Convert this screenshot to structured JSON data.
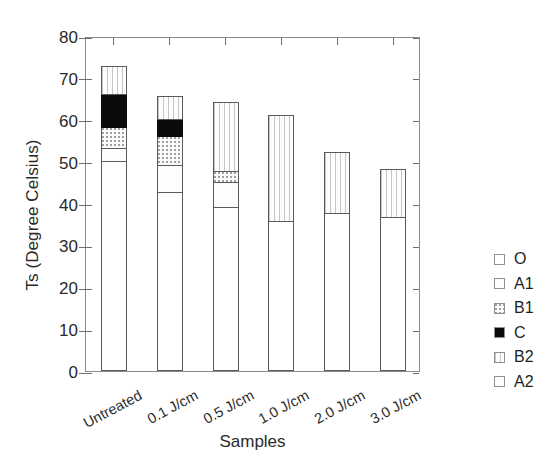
{
  "chart_data": {
    "type": "bar",
    "title": "",
    "subtitle": "",
    "xlabel": "Samples",
    "ylabel": "Ts (Degree Celsius)",
    "ylim": [
      0,
      80
    ],
    "yticks": [
      0,
      10,
      20,
      30,
      40,
      50,
      60,
      70,
      80
    ],
    "ytick_labels": [
      "0",
      "10",
      "20",
      "30",
      "40",
      "50",
      "60",
      "70",
      "80"
    ],
    "grid": false,
    "legend_position": "right",
    "stacked": true,
    "categories": [
      "Untreated",
      "0.1 J/cm",
      "0.5 J/cm",
      "1.0 J/cm",
      "2.0 J/cm",
      "3.0 J/cm"
    ],
    "series": [
      {
        "name": "O",
        "pattern": "white",
        "values": [
          50.0,
          42.5,
          39.0,
          35.5,
          37.5,
          36.5
        ]
      },
      {
        "name": "A1",
        "pattern": "fine-dot",
        "values": [
          3.0,
          6.5,
          6.0,
          0.0,
          0.0,
          0.0
        ]
      },
      {
        "name": "B1",
        "pattern": "dense-stipple",
        "values": [
          5.0,
          7.0,
          2.5,
          0.0,
          0.0,
          0.0
        ]
      },
      {
        "name": "C",
        "pattern": "solid-black",
        "values": [
          8.0,
          4.0,
          0.0,
          0.0,
          0.0,
          0.0
        ]
      },
      {
        "name": "B2",
        "pattern": "vertical-dash",
        "values": [
          6.5,
          5.5,
          16.5,
          25.5,
          14.5,
          11.5
        ]
      },
      {
        "name": "A2",
        "pattern": "fine-dot",
        "values": [
          0.0,
          0.0,
          0.0,
          0.0,
          0.0,
          0.0
        ]
      }
    ],
    "totals": [
      72.5,
      65.5,
      64.0,
      61.0,
      52.0,
      48.0
    ],
    "series_colors": {
      "O": "#ffffff",
      "A1": "#fdfdfd",
      "B1": "#fafafa",
      "C": "#0b0b0b",
      "B2": "#fdfdfd",
      "A2": "#fdfdfd"
    },
    "axis_color": "#6e6e6e",
    "text_color": "#2a2a2a"
  },
  "legend": {
    "items": [
      {
        "label": "O"
      },
      {
        "label": "A1"
      },
      {
        "label": "B1"
      },
      {
        "label": "C"
      },
      {
        "label": "B2"
      },
      {
        "label": "A2"
      }
    ]
  }
}
